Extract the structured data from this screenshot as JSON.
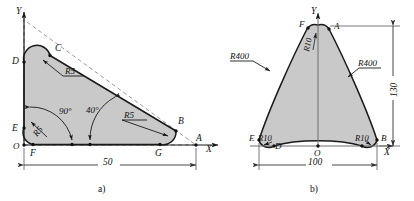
{
  "figure": {
    "title_a": "a)",
    "title_b": "b)",
    "stroke_color": "#1a1a1a",
    "fill_color": "#c9c9c9",
    "dim_color": "#555555",
    "background": "#ffffff"
  },
  "diagram_a": {
    "caption": "a)",
    "axis_y_label": "Y",
    "axis_x_label": "X",
    "origin_label": "O",
    "points": [
      {
        "id": "A",
        "label": "A"
      },
      {
        "id": "B",
        "label": "B"
      },
      {
        "id": "C",
        "label": "C"
      },
      {
        "id": "D",
        "label": "D"
      },
      {
        "id": "E",
        "label": "E"
      },
      {
        "id": "F",
        "label": "F"
      },
      {
        "id": "G",
        "label": "G"
      }
    ],
    "radii": [
      {
        "id": "r5-top",
        "label": "R5"
      },
      {
        "id": "r5-left",
        "label": "R5"
      },
      {
        "id": "r5-right",
        "label": "R5"
      }
    ],
    "angles": [
      {
        "id": "angle-90",
        "label": "90°"
      },
      {
        "id": "angle-40",
        "label": "40°"
      }
    ],
    "dimensions": [
      {
        "id": "width-50",
        "label": "50"
      }
    ]
  },
  "diagram_b": {
    "caption": "b)",
    "axis_y_label": "Y",
    "axis_x_label": "X",
    "origin_label": "O",
    "points": [
      {
        "id": "A",
        "label": "A"
      },
      {
        "id": "B",
        "label": "B"
      },
      {
        "id": "D",
        "label": "D"
      },
      {
        "id": "E",
        "label": "E"
      },
      {
        "id": "F",
        "label": "F"
      }
    ],
    "radii": [
      {
        "id": "r10-top",
        "label": "R10"
      },
      {
        "id": "r10-left",
        "label": "R10"
      },
      {
        "id": "r10-right",
        "label": "R10"
      },
      {
        "id": "r400-left",
        "label": "R400"
      },
      {
        "id": "r400-right",
        "label": "R400"
      }
    ],
    "dimensions": [
      {
        "id": "width-100",
        "label": "100"
      },
      {
        "id": "height-130",
        "label": "130"
      }
    ]
  }
}
